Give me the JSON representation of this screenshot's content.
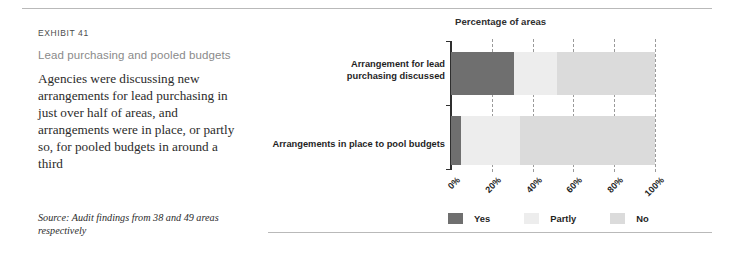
{
  "exhibit": {
    "label": "EXHIBIT 41",
    "title": "Lead purchasing and pooled budgets",
    "description": "Agencies were discussing new arrangements for lead purchasing in just over half of areas, and arrangements were in place, or partly so, for pooled budgets in around a third",
    "source": "Source: Audit findings from 38 and 49 areas respectively"
  },
  "colors": {
    "yes": "#6f6f6f",
    "partly": "#ededed",
    "no": "#dbdbdb",
    "axis": "#2f2f2f",
    "gridline": "#9a9a9a",
    "rule": "#b9b9b9",
    "title_gray": "#8a8a8a"
  },
  "chart_data": {
    "type": "bar",
    "orientation": "horizontal",
    "stacked": true,
    "title": "Percentage of areas",
    "xlabel": "",
    "ylabel": "",
    "xlim": [
      0,
      100
    ],
    "grid": true,
    "legend_position": "bottom",
    "categories": [
      "Arrangement for lead\npurchasing discussed",
      "Arrangements in place to pool budgets"
    ],
    "tick_labels": [
      "0%",
      "20%",
      "40%",
      "60%",
      "80%",
      "100%"
    ],
    "tick_values": [
      0,
      20,
      40,
      60,
      80,
      100
    ],
    "series": [
      {
        "name": "Yes",
        "values": [
          31,
          5
        ]
      },
      {
        "name": "Partly",
        "values": [
          21,
          29
        ]
      },
      {
        "name": "No",
        "values": [
          48,
          66
        ]
      }
    ]
  },
  "legend": [
    {
      "label": "Yes"
    },
    {
      "label": "Partly"
    },
    {
      "label": "No"
    }
  ]
}
